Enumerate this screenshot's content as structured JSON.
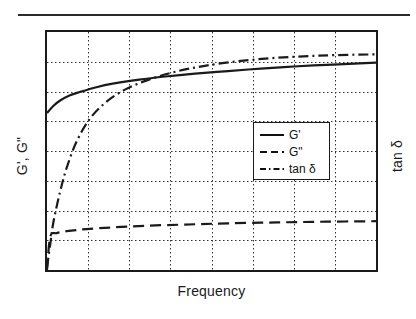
{
  "figure": {
    "background": "#ffffff",
    "line_color": "#1a1a1a"
  },
  "axes": {
    "xlabel": "Frequency",
    "ylabel_left": "G', G\"",
    "ylabel_right": "tan δ"
  },
  "legend": {
    "entries": [
      {
        "label": "G'",
        "style": "solid",
        "icon": "solid-line-icon"
      },
      {
        "label": "G\"",
        "style": "dashed",
        "icon": "dashed-line-icon"
      },
      {
        "label": "tan δ",
        "style": "dashdot",
        "icon": "dashdot-line-icon"
      }
    ]
  },
  "chart_data": {
    "type": "line",
    "title": "",
    "subtitle": "",
    "xlabel": "Frequency",
    "ylabel": "G', G\"",
    "ylabel_secondary": "tan δ",
    "xticklabels": [],
    "yticklabels": [],
    "grid": true,
    "grid_style": "dotted",
    "grid_x_count": 7,
    "grid_y_count": 7,
    "xlim": [
      0,
      1
    ],
    "ylim": [
      0,
      1
    ],
    "legend_position": "center-right",
    "note": "Schematic rheology plot: axes are unlabeled/qualitative; values below are normalized 0-1 fractions of the plot box (y=0 bottom, y=1 top).",
    "series": [
      {
        "name": "G'",
        "style": "solid",
        "axis": "left",
        "color": "#1a1a1a",
        "x": [
          0.0,
          0.02,
          0.04,
          0.07,
          0.1,
          0.15,
          0.2,
          0.28,
          0.36,
          0.45,
          0.55,
          0.65,
          0.75,
          0.85,
          0.95,
          1.0
        ],
        "y": [
          0.66,
          0.69,
          0.712,
          0.734,
          0.748,
          0.768,
          0.783,
          0.8,
          0.813,
          0.825,
          0.836,
          0.846,
          0.855,
          0.862,
          0.868,
          0.871
        ]
      },
      {
        "name": "G\"",
        "style": "dashed",
        "axis": "left",
        "color": "#1a1a1a",
        "x": [
          0.0,
          0.01,
          0.03,
          0.06,
          0.12,
          0.2,
          0.3,
          0.42,
          0.55,
          0.7,
          0.85,
          1.0
        ],
        "y": [
          0.0,
          0.14,
          0.155,
          0.163,
          0.172,
          0.179,
          0.186,
          0.191,
          0.196,
          0.2,
          0.203,
          0.205
        ]
      },
      {
        "name": "tan δ",
        "style": "dashdot",
        "axis": "right",
        "color": "#1a1a1a",
        "x": [
          0.0,
          0.01,
          0.02,
          0.04,
          0.06,
          0.09,
          0.13,
          0.18,
          0.24,
          0.31,
          0.39,
          0.48,
          0.58,
          0.68,
          0.78,
          0.88,
          1.0
        ],
        "y": [
          0.01,
          0.11,
          0.205,
          0.33,
          0.43,
          0.54,
          0.635,
          0.706,
          0.76,
          0.8,
          0.833,
          0.858,
          0.877,
          0.89,
          0.898,
          0.903,
          0.906
        ]
      }
    ]
  }
}
